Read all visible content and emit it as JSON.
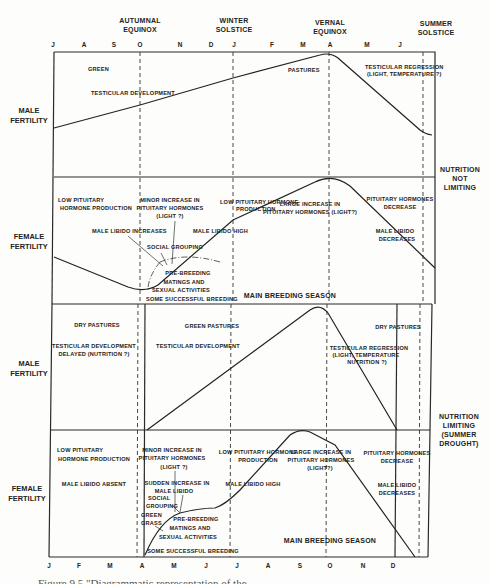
{
  "header": {
    "events": [
      {
        "label_lines": [
          "AUTUMNAL",
          "EQUINOX"
        ],
        "x": 140
      },
      {
        "label_lines": [
          "WINTER",
          "SOLSTICE"
        ],
        "x": 234
      },
      {
        "label_lines": [
          "VERNAL",
          "EQUINOX"
        ],
        "x": 334
      },
      {
        "label_lines": [
          "SUMMER",
          "SOLSTICE"
        ],
        "x": 438
      }
    ],
    "top_months": [
      {
        "m": "J",
        "x": 53
      },
      {
        "m": "A",
        "x": 84
      },
      {
        "m": "S",
        "x": 114
      },
      {
        "m": "O",
        "x": 140
      },
      {
        "m": "N",
        "x": 180
      },
      {
        "m": "D",
        "x": 211
      },
      {
        "m": "J",
        "x": 234
      },
      {
        "m": "F",
        "x": 272
      },
      {
        "m": "M",
        "x": 303
      },
      {
        "m": "A",
        "x": 330
      },
      {
        "m": "M",
        "x": 367
      },
      {
        "m": "J",
        "x": 400
      }
    ],
    "bottom_months": [
      {
        "m": "J",
        "x": 49
      },
      {
        "m": "F",
        "x": 79
      },
      {
        "m": "M",
        "x": 110
      },
      {
        "m": "A",
        "x": 142
      },
      {
        "m": "M",
        "x": 174
      },
      {
        "m": "J",
        "x": 206
      },
      {
        "m": "J",
        "x": 237
      },
      {
        "m": "A",
        "x": 268
      },
      {
        "m": "S",
        "x": 300
      },
      {
        "m": "O",
        "x": 330
      },
      {
        "m": "N",
        "x": 363
      },
      {
        "m": "D",
        "x": 393
      }
    ]
  },
  "rows": [
    {
      "label_lines": [
        "MALE",
        "FERTILITY"
      ]
    },
    {
      "label_lines": [
        "FEMALE",
        "FERTILITY"
      ]
    },
    {
      "label_lines": [
        "MALE",
        "FERTILITY"
      ]
    },
    {
      "label_lines": [
        "FEMALE",
        "FERTILITY"
      ]
    }
  ],
  "groups": [
    {
      "label_lines": [
        "NUTRITION",
        "NOT",
        "LIMITING"
      ]
    },
    {
      "label_lines": [
        "NUTRITION",
        "LIMITING",
        "(SUMMER",
        "DROUGHT)"
      ]
    }
  ],
  "panel1": {
    "green": "GREEN",
    "testicular": "TESTICULAR DEVELOPMENT",
    "pastures": "PASTURES",
    "regression_lines": [
      "TESTICULAR REGRESSION",
      "(LIGHT, TEMPERATURE ?)"
    ]
  },
  "panel2": {
    "low_pituitary_lines": [
      "LOW PITUITARY",
      "HORMONE PRODUCTION"
    ],
    "minor_increase_lines": [
      "MINOR INCREASE IN",
      "PITUITARY HORMONES",
      "(LIGHT ?)"
    ],
    "low_pituitary2_lines": [
      "LOW PITUITARY HORMONE",
      "PRODUCTION"
    ],
    "large_increase_lines": [
      "LARGE INCREASE IN",
      "PITUITARY HORMONES (LIGHT?)"
    ],
    "pit_decrease_lines": [
      "PITUITARY HORMONES",
      "DECREASE"
    ],
    "libido_increases": "MALE LIBIDO INCREASES",
    "libido_high": "MALE LIBIDO HIGH",
    "libido_decreases_lines": [
      "MALE LIBIDO",
      "DECREASES"
    ],
    "social_grouping": "SOCIAL GROUPING",
    "prebreeding_lines": [
      "PRE-BREEDING",
      "MATINGS AND",
      "SEXUAL ACTIVITIES"
    ],
    "some_breeding": "SOME SUCCESSFUL BREEDING",
    "main_breeding": "MAIN BREEDING SEASON"
  },
  "panel3": {
    "dry_pastures_1": "DRY   PASTURES",
    "delayed_lines": [
      "TESTICULAR DEVELOPMENT",
      "DELAYED (NUTRITION ?)"
    ],
    "green_pastures": "GREEN   PASTURES",
    "testicular": "TESTICULAR DEVELOPMENT",
    "dry_pastures_2": "DRY   PASTURES",
    "regression_lines": [
      "TESTICULAR REGRESSION",
      "(LIGHT, TEMPERATURE",
      "NUTRITION ?)"
    ]
  },
  "panel4": {
    "low_pituitary_lines": [
      "LOW PITUITARY",
      "HORMONE PRODUCTION"
    ],
    "libido_absent": "MALE LIBIDO ABSENT",
    "minor_increase_lines": [
      "MINOR INCREASE IN",
      "PITUITARY HORMONES",
      "(LIGHT ?)"
    ],
    "sudden_increase_lines": [
      "SUDDEN INCREASE IN",
      "MALE LIBIDO"
    ],
    "social_lines": [
      "SOCIAL",
      "GROUPING"
    ],
    "green_grass_lines": [
      "GREEN",
      "GRASS"
    ],
    "prebreeding_lines": [
      "PRE-BREEDING",
      "MATINGS AND",
      "SEXUAL ACTIVITIES"
    ],
    "low_pituitary2_lines": [
      "LOW PITUITARY HORMONE",
      "PRODUCTION"
    ],
    "libido_high": "MALE LIBIDO HIGH",
    "large_increase_lines": [
      "LARGE INCREASE IN",
      "PITUITARY HORMONES",
      "(LIGHT?)"
    ],
    "pit_decrease_lines": [
      "PITUITARY HORMONES",
      "DECREASE"
    ],
    "libido_decreases_lines": [
      "MALE LIBIDO",
      "DECREASES"
    ],
    "some_breeding": "SOME SUCCESSFUL BREEDING",
    "main_breeding": "MAIN   BREEDING   SEASON"
  },
  "caption": "Figure 9.5 \"Diagrammatic representation of the ..."
}
